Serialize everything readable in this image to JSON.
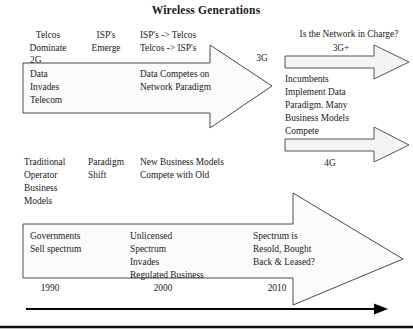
{
  "figure": {
    "title": "Wireless Generations",
    "top_row": {
      "col1": [
        "Telcos",
        "Dominate",
        "2G"
      ],
      "col2": [
        "ISP's",
        "Emerge"
      ],
      "col3": [
        "ISP's -> Telcos",
        "Telcos -> ISP's"
      ]
    },
    "band1_box": {
      "left_lines": [
        "Data",
        "Invades",
        "Telecom"
      ],
      "mid_lines": [
        "Data Competes on",
        "Network Paradigm"
      ]
    },
    "mid_row": {
      "col1": [
        "Traditional",
        "Operator",
        "Business",
        "Models"
      ],
      "col2": [
        "Paradigm",
        "Shift"
      ],
      "col3": [
        "New Business Models",
        "Compete with Old"
      ]
    },
    "band2_box": {
      "col1": [
        "Governments",
        "Sell spectrum"
      ],
      "col2": [
        "Unlicensed",
        "Spectrum",
        "Invades",
        "Regulated Business"
      ],
      "col3": [
        "Spectrum is",
        "Resold, Bought",
        "Back & Leased?"
      ]
    },
    "generations": {
      "g3": "3G",
      "g3plus": "3G+",
      "g4": "4G"
    },
    "right_panel": {
      "question": "Is the Network in Charge?",
      "lines": [
        "Incumbents",
        "Implement Data",
        "Paradigm. Many",
        "Business Models",
        "Compete"
      ]
    },
    "years": [
      "1990",
      "2000",
      "2010"
    ],
    "colors": {
      "arrow_fill": "#fbfbfb",
      "arrow_stroke": "#4a4a4a",
      "thin_arrow_fill": "#f4f4f4",
      "thin_arrow_stroke": "#555555",
      "axis": "#000000",
      "text": "#1a1a1a"
    }
  }
}
